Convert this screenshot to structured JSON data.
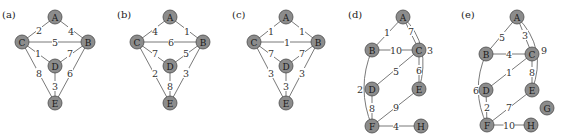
{
  "colors": {
    "node_fill": "#8c8c8c",
    "node_stroke": "#4a4a4a",
    "edge": "#6a6a6a",
    "text": "#1a1a1a"
  },
  "panels": [
    {
      "label": "(a)",
      "label_pos": [
        2,
        18
      ],
      "nodes": [
        {
          "id": "A",
          "x": 55,
          "y": 17
        },
        {
          "id": "C",
          "x": 22,
          "y": 42
        },
        {
          "id": "B",
          "x": 88,
          "y": 42
        },
        {
          "id": "D",
          "x": 55,
          "y": 66
        },
        {
          "id": "E",
          "x": 55,
          "y": 103
        }
      ],
      "edges": [
        {
          "from": "A",
          "to": "C",
          "w": "2",
          "lx": 39,
          "ly": 30
        },
        {
          "from": "A",
          "to": "B",
          "w": "4",
          "lx": 71,
          "ly": 31
        },
        {
          "from": "C",
          "to": "B",
          "w": "5",
          "lx": 55,
          "ly": 42
        },
        {
          "from": "C",
          "to": "D",
          "w": "1",
          "lx": 38,
          "ly": 53
        },
        {
          "from": "B",
          "to": "D",
          "w": "7",
          "lx": 70,
          "ly": 53
        },
        {
          "from": "C",
          "to": "E",
          "w": "8",
          "lx": 39,
          "ly": 73
        },
        {
          "from": "B",
          "to": "E",
          "w": "6",
          "lx": 70,
          "ly": 73
        },
        {
          "from": "D",
          "to": "E",
          "w": "3",
          "lx": 55,
          "ly": 86
        }
      ]
    },
    {
      "label": "(b)",
      "label_pos": [
        117,
        18
      ],
      "nodes": [
        {
          "id": "A",
          "x": 170,
          "y": 17
        },
        {
          "id": "C",
          "x": 137,
          "y": 42
        },
        {
          "id": "B",
          "x": 203,
          "y": 42
        },
        {
          "id": "D",
          "x": 170,
          "y": 66
        },
        {
          "id": "E",
          "x": 170,
          "y": 103
        }
      ],
      "edges": [
        {
          "from": "A",
          "to": "C",
          "w": "4",
          "lx": 155,
          "ly": 31
        },
        {
          "from": "A",
          "to": "B",
          "w": "1",
          "lx": 187,
          "ly": 31
        },
        {
          "from": "C",
          "to": "B",
          "w": "6",
          "lx": 171,
          "ly": 42
        },
        {
          "from": "C",
          "to": "D",
          "w": "7",
          "lx": 155,
          "ly": 53
        },
        {
          "from": "B",
          "to": "D",
          "w": "5",
          "lx": 186,
          "ly": 53
        },
        {
          "from": "C",
          "to": "E",
          "w": "2",
          "lx": 155,
          "ly": 73
        },
        {
          "from": "B",
          "to": "E",
          "w": "3",
          "lx": 186,
          "ly": 73
        },
        {
          "from": "D",
          "to": "E",
          "w": "8",
          "lx": 170,
          "ly": 86
        }
      ]
    },
    {
      "label": "(c)",
      "label_pos": [
        232,
        18
      ],
      "nodes": [
        {
          "id": "A",
          "x": 286,
          "y": 17
        },
        {
          "id": "C",
          "x": 254,
          "y": 42
        },
        {
          "id": "B",
          "x": 318,
          "y": 42
        },
        {
          "id": "D",
          "x": 286,
          "y": 66
        },
        {
          "id": "E",
          "x": 286,
          "y": 103
        }
      ],
      "edges": [
        {
          "from": "A",
          "to": "C",
          "w": "1",
          "lx": 271,
          "ly": 31
        },
        {
          "from": "A",
          "to": "B",
          "w": "1",
          "lx": 302,
          "ly": 31
        },
        {
          "from": "C",
          "to": "B",
          "w": "1",
          "lx": 287,
          "ly": 42
        },
        {
          "from": "C",
          "to": "D",
          "w": "7",
          "lx": 271,
          "ly": 53
        },
        {
          "from": "B",
          "to": "D",
          "w": "7",
          "lx": 302,
          "ly": 53
        },
        {
          "from": "C",
          "to": "E",
          "w": "3",
          "lx": 271,
          "ly": 73
        },
        {
          "from": "B",
          "to": "E",
          "w": "3",
          "lx": 302,
          "ly": 73
        },
        {
          "from": "D",
          "to": "E",
          "w": "3",
          "lx": 286,
          "ly": 86
        }
      ]
    },
    {
      "label": "(d)",
      "label_pos": [
        348,
        18
      ],
      "nodes": [
        {
          "id": "A",
          "x": 403,
          "y": 17
        },
        {
          "id": "B",
          "x": 372,
          "y": 50
        },
        {
          "id": "C",
          "x": 419,
          "y": 50
        },
        {
          "id": "D",
          "x": 372,
          "y": 89
        },
        {
          "id": "E",
          "x": 419,
          "y": 89
        },
        {
          "id": "F",
          "x": 372,
          "y": 126
        },
        {
          "id": "H",
          "x": 421,
          "y": 126
        }
      ],
      "edges": [
        {
          "from": "A",
          "to": "B",
          "w": "1",
          "lx": 387,
          "ly": 32
        },
        {
          "from": "A",
          "to": "C",
          "w": "7",
          "lx": 411,
          "ly": 31
        },
        {
          "from": "A",
          "to": "E",
          "w": "3",
          "lx": 430,
          "ly": 50,
          "curve": [
            432,
            45
          ]
        },
        {
          "from": "B",
          "to": "C",
          "w": "10",
          "lx": 396,
          "ly": 50
        },
        {
          "from": "C",
          "to": "D",
          "w": "5",
          "lx": 396,
          "ly": 71
        },
        {
          "from": "C",
          "to": "E",
          "w": "6",
          "lx": 419,
          "ly": 70
        },
        {
          "from": "B",
          "to": "F",
          "w": "2",
          "lx": 360,
          "ly": 89,
          "curve": [
            356,
            88
          ]
        },
        {
          "from": "D",
          "to": "F",
          "w": "8",
          "lx": 372,
          "ly": 108
        },
        {
          "from": "E",
          "to": "F",
          "w": "9",
          "lx": 396,
          "ly": 107
        },
        {
          "from": "F",
          "to": "H",
          "w": "4",
          "lx": 396,
          "ly": 126
        }
      ]
    },
    {
      "label": "(e)",
      "label_pos": [
        461,
        18
      ],
      "nodes": [
        {
          "id": "A",
          "x": 517,
          "y": 17
        },
        {
          "id": "B",
          "x": 486,
          "y": 54
        },
        {
          "id": "C",
          "x": 532,
          "y": 54
        },
        {
          "id": "D",
          "x": 486,
          "y": 90
        },
        {
          "id": "E",
          "x": 532,
          "y": 90
        },
        {
          "id": "G",
          "x": 547,
          "y": 108
        },
        {
          "id": "F",
          "x": 487,
          "y": 125
        },
        {
          "id": "H",
          "x": 531,
          "y": 125
        }
      ],
      "edges": [
        {
          "from": "A",
          "to": "B",
          "w": "5",
          "lx": 502,
          "ly": 37
        },
        {
          "from": "A",
          "to": "C",
          "w": "3",
          "lx": 525,
          "ly": 35
        },
        {
          "from": "A",
          "to": "E",
          "w": "9",
          "lx": 544,
          "ly": 50,
          "curve": [
            548,
            48
          ]
        },
        {
          "from": "B",
          "to": "C",
          "w": "4",
          "lx": 509,
          "ly": 54
        },
        {
          "from": "C",
          "to": "D",
          "w": "1",
          "lx": 509,
          "ly": 72
        },
        {
          "from": "C",
          "to": "E",
          "w": "8",
          "lx": 532,
          "ly": 72
        },
        {
          "from": "B",
          "to": "F",
          "w": "6",
          "lx": 476,
          "ly": 90,
          "curve": [
            470,
            90
          ]
        },
        {
          "from": "D",
          "to": "F",
          "w": "2",
          "lx": 487,
          "ly": 107
        },
        {
          "from": "E",
          "to": "F",
          "w": "7",
          "lx": 509,
          "ly": 107
        },
        {
          "from": "F",
          "to": "H",
          "w": "10",
          "lx": 509,
          "ly": 125
        }
      ]
    }
  ]
}
